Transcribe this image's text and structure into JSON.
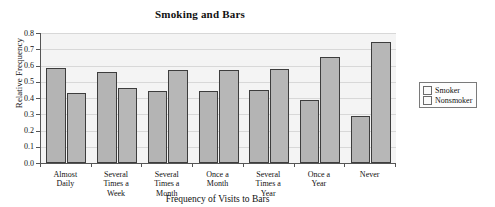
{
  "chart_data": {
    "type": "bar",
    "title": "Smoking and Bars",
    "xlabel": "Frequency of Visits to Bars",
    "ylabel": "Relative Frequency",
    "categories": [
      "Almost Daily",
      "Several Times a Week",
      "Several Times a Month",
      "Once a Month",
      "Several Times a Year",
      "Once a Year",
      "Never"
    ],
    "category_lines": [
      [
        "Almost",
        "Daily"
      ],
      [
        "Several",
        "Times a",
        "Week"
      ],
      [
        "Several",
        "Times a",
        "Month"
      ],
      [
        "Once a",
        "Month"
      ],
      [
        "Several",
        "Times a",
        "Year"
      ],
      [
        "Once a",
        "Year"
      ],
      [
        "Never"
      ]
    ],
    "series": [
      {
        "name": "Smoker",
        "values": [
          0.585,
          0.56,
          0.445,
          0.445,
          0.45,
          0.385,
          0.29
        ]
      },
      {
        "name": "Nonsmoker",
        "values": [
          0.43,
          0.46,
          0.575,
          0.575,
          0.58,
          0.65,
          0.745
        ]
      }
    ],
    "ylim": [
      0.0,
      0.8
    ],
    "ytick_labels": [
      "0.0",
      "0.1",
      "0.2",
      "0.3",
      "0.4",
      "0.5",
      "0.6",
      "0.7",
      "0.8"
    ],
    "ytick_values": [
      0.0,
      0.1,
      0.2,
      0.3,
      0.4,
      0.5,
      0.6,
      0.7,
      0.8
    ],
    "grid": true,
    "legend_position": "right",
    "colors": {
      "smoker": "#b4b4b4",
      "nonsmoker": "#b7b7b7",
      "bar_border": "#3d3d3d",
      "plot_background": "#f4f4f4",
      "gridline": "#d8d8d8",
      "axis": "#555555",
      "text": "#111111"
    }
  },
  "legend": {
    "items": [
      {
        "label": "Smoker"
      },
      {
        "label": "Nonsmoker"
      }
    ]
  }
}
